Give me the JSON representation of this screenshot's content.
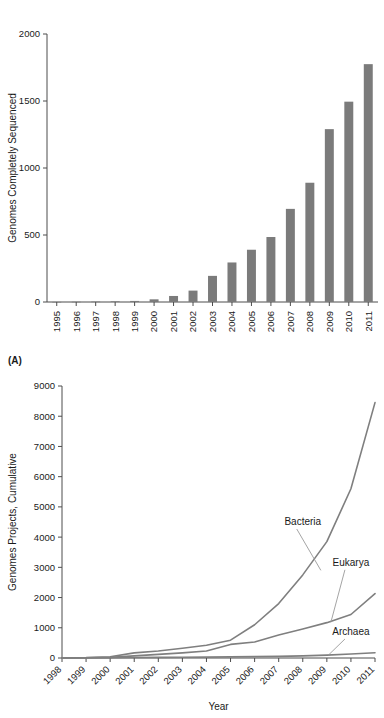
{
  "figure": {
    "panel_a_letter": "(A)"
  },
  "chart_data": [
    {
      "id": "panel_a",
      "type": "bar",
      "title": "",
      "xlabel": "",
      "ylabel": "Genomes Completely Sequenced",
      "categories": [
        "1995",
        "1996",
        "1997",
        "1998",
        "1999",
        "2000",
        "2001",
        "2002",
        "2003",
        "2004",
        "2005",
        "2006",
        "2007",
        "2008",
        "2009",
        "2010",
        "2011"
      ],
      "values": [
        1,
        2,
        3,
        5,
        8,
        20,
        45,
        85,
        195,
        295,
        390,
        485,
        695,
        890,
        1290,
        1495,
        1775
      ],
      "ylim": [
        0,
        2000
      ],
      "yticks": [
        0,
        500,
        1000,
        1500,
        2000
      ],
      "ytick_labels": [
        "0",
        "500",
        "1000",
        "1500",
        "2000"
      ],
      "grid": false,
      "bar_color": "#7b7b7b"
    },
    {
      "id": "panel_b",
      "type": "line",
      "title": "",
      "xlabel": "Year",
      "ylabel": "Genomes Projects, Cumulative",
      "x": [
        "1998",
        "1999",
        "2000",
        "2001",
        "2002",
        "2003",
        "2004",
        "2005",
        "2006",
        "2007",
        "2008",
        "2009",
        "2010",
        "2011"
      ],
      "ylim": [
        0,
        9000
      ],
      "yticks": [
        0,
        1000,
        2000,
        3000,
        4000,
        5000,
        6000,
        7000,
        8000,
        9000
      ],
      "ytick_labels": [
        "0",
        "1000",
        "2000",
        "3000",
        "4000",
        "5000",
        "6000",
        "7000",
        "8000",
        "9000"
      ],
      "grid": false,
      "legend_position": "inline-annotations",
      "series": [
        {
          "name": "Bacteria",
          "color": "#7f7f7f",
          "values": [
            10,
            15,
            40,
            170,
            230,
            320,
            420,
            590,
            1100,
            1800,
            2750,
            3850,
            5600,
            8450
          ]
        },
        {
          "name": "Eukarya",
          "color": "#7f7f7f",
          "values": [
            5,
            8,
            20,
            70,
            120,
            170,
            230,
            450,
            530,
            760,
            960,
            1170,
            1440,
            2130
          ]
        },
        {
          "name": "Archaea",
          "color": "#8d8d8d",
          "values": [
            2,
            3,
            8,
            15,
            20,
            25,
            30,
            38,
            45,
            55,
            70,
            95,
            130,
            175
          ]
        }
      ],
      "annotations": [
        {
          "label": "Bacteria",
          "x": 2008,
          "y": 4400
        },
        {
          "label": "Eukarya",
          "x": 2010,
          "y": 3050
        },
        {
          "label": "Archaea",
          "x": 2010,
          "y": 760
        }
      ]
    }
  ]
}
